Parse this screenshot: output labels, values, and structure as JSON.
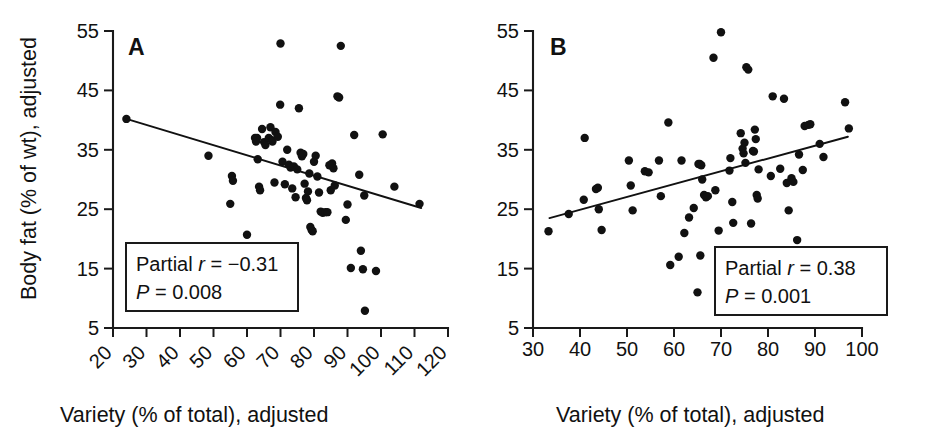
{
  "figure": {
    "background": "#ffffff",
    "ink_color": "#111111",
    "width": 925,
    "height": 436,
    "panel_count": 2
  },
  "chart_data": [
    {
      "type": "scatter",
      "panel_letter": "A",
      "title": "",
      "xlabel": "Variety (% of total), adjusted",
      "ylabel": "Body fat (% of wt), adjusted",
      "xlim": [
        20,
        120
      ],
      "ylim": [
        5,
        55
      ],
      "xticks": [
        20,
        30,
        40,
        50,
        60,
        70,
        80,
        90,
        100,
        110,
        120
      ],
      "xtick_labels": [
        "20",
        "30",
        "40",
        "50",
        "60",
        "70",
        "80",
        "90",
        "100",
        "110",
        "120"
      ],
      "xtick_label_rotation": -45,
      "yticks": [
        5,
        15,
        25,
        35,
        45,
        55
      ],
      "ytick_labels": [
        "5",
        "15",
        "25",
        "35",
        "45",
        "55"
      ],
      "grid": false,
      "legend": null,
      "annotation": {
        "line1_prefix": "Partial ",
        "line1_symbol": "r",
        "line1_value": " = −0.31",
        "line2_symbol": "P",
        "line2_value": " = 0.008",
        "statistic": "Partial r",
        "r": -0.31,
        "p": 0.008
      },
      "fit_line": {
        "x0": 24,
        "y0": 40.2,
        "x1": 112,
        "y1": 25.2
      },
      "points": [
        [
          24.0,
          40.2
        ],
        [
          48.5,
          34.0
        ],
        [
          55.5,
          30.6
        ],
        [
          55.8,
          29.8
        ],
        [
          55.0,
          25.9
        ],
        [
          60.0,
          20.7
        ],
        [
          62.4,
          37.0
        ],
        [
          62.7,
          36.4
        ],
        [
          63.0,
          37.0
        ],
        [
          63.2,
          33.4
        ],
        [
          63.6,
          28.8
        ],
        [
          63.9,
          28.2
        ],
        [
          64.5,
          38.5
        ],
        [
          65.1,
          36.3
        ],
        [
          65.5,
          35.8
        ],
        [
          66.5,
          37.0
        ],
        [
          67.0,
          38.8
        ],
        [
          67.4,
          36.6
        ],
        [
          67.6,
          36.4
        ],
        [
          68.2,
          29.5
        ],
        [
          68.5,
          38.0
        ],
        [
          69.2,
          37.2
        ],
        [
          69.9,
          42.6
        ],
        [
          70.6,
          33.0
        ],
        [
          71.3,
          29.2
        ],
        [
          72.0,
          35.0
        ],
        [
          72.5,
          32.5
        ],
        [
          73.0,
          32.0
        ],
        [
          73.5,
          28.5
        ],
        [
          74.0,
          32.2
        ],
        [
          74.5,
          27.0
        ],
        [
          75.0,
          31.7
        ],
        [
          75.5,
          42.0
        ],
        [
          76.0,
          34.5
        ],
        [
          76.4,
          33.9
        ],
        [
          76.8,
          34.3
        ],
        [
          77.2,
          29.3
        ],
        [
          77.6,
          26.9
        ],
        [
          77.9,
          26.5
        ],
        [
          78.2,
          28.0
        ],
        [
          78.6,
          31.0
        ],
        [
          78.9,
          22.0
        ],
        [
          79.3,
          21.5
        ],
        [
          79.6,
          21.3
        ],
        [
          80.0,
          33.0
        ],
        [
          80.5,
          34.0
        ],
        [
          81.0,
          30.5
        ],
        [
          81.5,
          27.8
        ],
        [
          82.0,
          24.6
        ],
        [
          82.6,
          24.4
        ],
        [
          83.4,
          24.5
        ],
        [
          84.0,
          24.5
        ],
        [
          84.6,
          32.4
        ],
        [
          85.0,
          28.2
        ],
        [
          85.4,
          32.7
        ],
        [
          85.8,
          31.9
        ],
        [
          86.2,
          29.0
        ],
        [
          87.0,
          44.0
        ],
        [
          87.5,
          43.8
        ],
        [
          88.0,
          52.5
        ],
        [
          89.5,
          23.2
        ],
        [
          90.0,
          25.8
        ],
        [
          91.0,
          15.1
        ],
        [
          92.0,
          37.5
        ],
        [
          93.5,
          30.8
        ],
        [
          94.0,
          18.0
        ],
        [
          94.6,
          14.9
        ],
        [
          95.0,
          27.3
        ],
        [
          95.2,
          7.9
        ],
        [
          98.5,
          14.6
        ],
        [
          100.5,
          37.6
        ],
        [
          104.0,
          28.8
        ],
        [
          111.5,
          25.9
        ],
        [
          70.0,
          52.9
        ]
      ]
    },
    {
      "type": "scatter",
      "panel_letter": "B",
      "title": "",
      "xlabel": "Variety (% of total), adjusted",
      "ylabel": "",
      "xlim": [
        30,
        100
      ],
      "ylim": [
        5,
        55
      ],
      "xticks": [
        30,
        40,
        50,
        60,
        70,
        80,
        90,
        100
      ],
      "xtick_labels": [
        "30",
        "40",
        "50",
        "60",
        "70",
        "80",
        "90",
        "100"
      ],
      "xtick_label_rotation": 0,
      "yticks": [
        5,
        15,
        25,
        35,
        45,
        55
      ],
      "ytick_labels": [
        "5",
        "15",
        "25",
        "35",
        "45",
        "55"
      ],
      "grid": false,
      "legend": null,
      "annotation": {
        "line1_prefix": "Partial ",
        "line1_symbol": "r",
        "line1_value": " = 0.38",
        "line2_symbol": "P",
        "line2_value": " = 0.001",
        "statistic": "Partial r",
        "r": 0.38,
        "p": 0.001
      },
      "fit_line": {
        "x0": 33.5,
        "y0": 23.5,
        "x1": 97.0,
        "y1": 37.2
      },
      "points": [
        [
          33.3,
          21.3
        ],
        [
          37.6,
          24.2
        ],
        [
          40.8,
          26.6
        ],
        [
          41.0,
          37.0
        ],
        [
          43.4,
          28.4
        ],
        [
          43.8,
          28.6
        ],
        [
          44.0,
          25.0
        ],
        [
          44.6,
          21.5
        ],
        [
          50.4,
          33.2
        ],
        [
          50.8,
          29.0
        ],
        [
          51.2,
          24.8
        ],
        [
          53.8,
          31.4
        ],
        [
          54.6,
          31.2
        ],
        [
          56.8,
          33.2
        ],
        [
          57.2,
          27.2
        ],
        [
          58.8,
          39.6
        ],
        [
          59.2,
          15.6
        ],
        [
          61.0,
          17.0
        ],
        [
          61.6,
          33.2
        ],
        [
          62.2,
          21.0
        ],
        [
          63.2,
          23.6
        ],
        [
          64.2,
          25.2
        ],
        [
          65.2,
          32.6
        ],
        [
          65.5,
          32.6
        ],
        [
          65.8,
          32.4
        ],
        [
          65.6,
          17.2
        ],
        [
          66.0,
          30.0
        ],
        [
          65.0,
          11.0
        ],
        [
          66.4,
          27.4
        ],
        [
          66.8,
          27.0
        ],
        [
          67.2,
          27.2
        ],
        [
          68.4,
          50.5
        ],
        [
          68.8,
          28.2
        ],
        [
          69.5,
          21.4
        ],
        [
          70.0,
          54.8
        ],
        [
          71.8,
          31.5
        ],
        [
          72.0,
          33.6
        ],
        [
          72.4,
          26.2
        ],
        [
          72.6,
          22.7
        ],
        [
          74.2,
          37.8
        ],
        [
          74.6,
          35.2
        ],
        [
          74.8,
          34.4
        ],
        [
          75.0,
          36.2
        ],
        [
          75.2,
          32.8
        ],
        [
          75.4,
          48.9
        ],
        [
          75.8,
          48.5
        ],
        [
          76.4,
          22.6
        ],
        [
          76.8,
          34.8
        ],
        [
          77.0,
          34.7
        ],
        [
          77.2,
          38.4
        ],
        [
          77.4,
          36.8
        ],
        [
          77.6,
          27.4
        ],
        [
          77.8,
          26.8
        ],
        [
          78.0,
          31.7
        ],
        [
          78.4,
          17.2
        ],
        [
          80.6,
          30.6
        ],
        [
          81.0,
          44.0
        ],
        [
          82.6,
          31.8
        ],
        [
          83.4,
          43.6
        ],
        [
          84.0,
          29.4
        ],
        [
          84.4,
          24.8
        ],
        [
          85.0,
          30.2
        ],
        [
          85.4,
          29.6
        ],
        [
          86.2,
          19.8
        ],
        [
          86.6,
          34.2
        ],
        [
          87.4,
          31.6
        ],
        [
          87.8,
          39.0
        ],
        [
          88.6,
          39.2
        ],
        [
          89.0,
          39.3
        ],
        [
          91.0,
          36.0
        ],
        [
          91.8,
          33.8
        ],
        [
          96.4,
          43.0
        ],
        [
          97.2,
          38.6
        ]
      ]
    }
  ]
}
